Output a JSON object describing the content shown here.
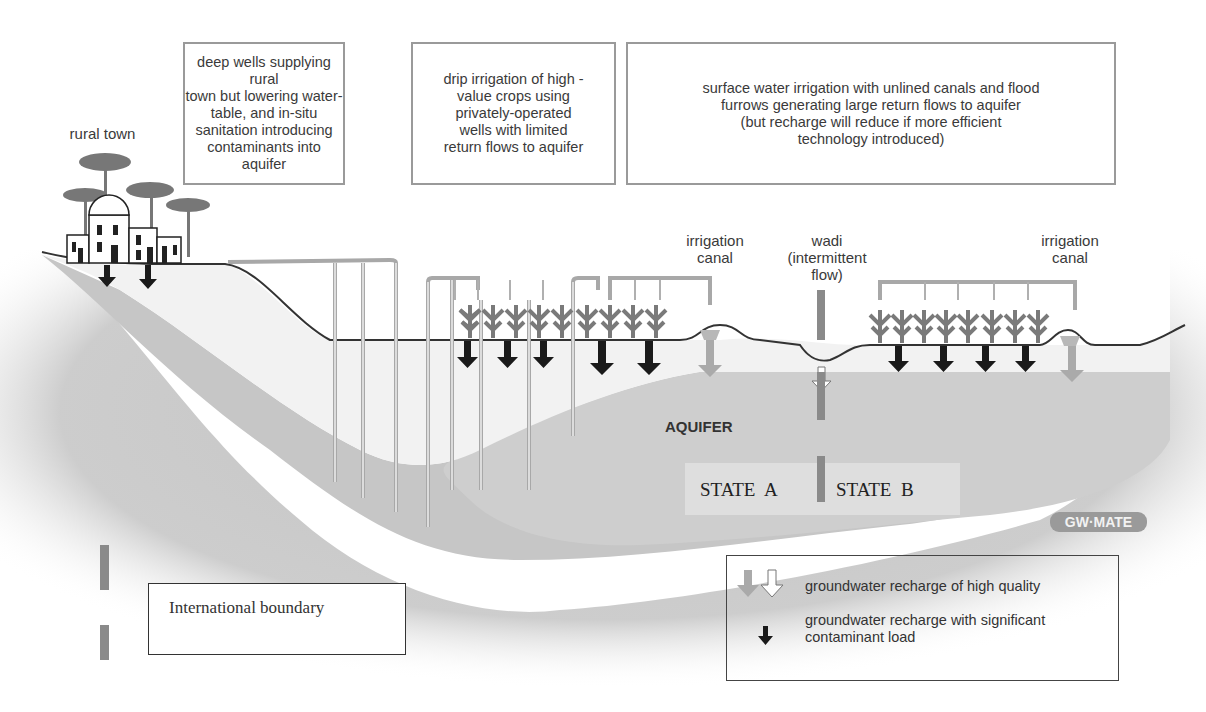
{
  "diagram": {
    "title_boxes": [
      {
        "text": "deep wells supplying rural\ntown but lowering water-\ntable, and in-situ\nsanitation introducing\ncontaminants into aquifer"
      },
      {
        "text": "drip irrigation of high -\nvalue crops using\nprivately-operated\nwells with limited\nreturn flows to aquifer"
      },
      {
        "text": "surface water irrigation with unlined canals and flood\nfurrows generating large return flows to aquifer\n(but recharge will reduce if more efficient\ntechnology introduced)"
      }
    ],
    "labels": {
      "rural_town": "rural town",
      "irrigation_canal_left": "irrigation\ncanal",
      "wadi": "wadi\n(intermittent\nflow)",
      "irrigation_canal_right": "irrigation\ncanal",
      "aquifer": "AQUIFER",
      "state_a": "STATE  A",
      "state_b": "STATE  B",
      "logo": "GW·MATE"
    },
    "boundary_legend": {
      "text": "International boundary"
    },
    "recharge_legend": {
      "items": [
        {
          "icon": "grey-and-white-down-arrows",
          "text": "groundwater recharge of high quality"
        },
        {
          "icon": "black-down-arrow",
          "text": "groundwater recharge with significant\ncontaminant load"
        }
      ]
    },
    "colors": {
      "aquifer_fill": "#c9c9c9",
      "deep_layer": "#b5b5b5",
      "unsaturated_zone": "#efefef",
      "ground_line": "#333333",
      "boundary_marker": "#8a8a8a",
      "clean_arrow": "#a8a8a8",
      "contaminant_arrow": "#1a1a1a",
      "box_border": "#9a9a9a"
    }
  }
}
